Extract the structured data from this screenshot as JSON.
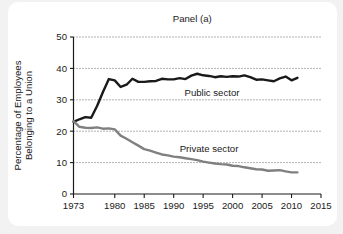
{
  "figure": {
    "background_color": "#f2f2f2",
    "card_color": "#ffffff"
  },
  "chart_data": {
    "type": "line",
    "title": "Panel (a)",
    "xlabel": "",
    "ylabel": "Percentage of Employees Belonging to a Union",
    "ylabel_line1": "Percentage of Employees",
    "ylabel_line2": "Belonging to a Union",
    "xlim": [
      1973,
      2015
    ],
    "ylim": [
      0,
      50
    ],
    "yticks": [
      0,
      10,
      20,
      30,
      40,
      50
    ],
    "ytick_labels": [
      "0",
      "10",
      "20",
      "30",
      "40",
      "50"
    ],
    "xticks": [
      1973,
      1980,
      1985,
      1990,
      1995,
      2000,
      2005,
      2010,
      2015
    ],
    "xtick_labels": [
      "1973",
      "1980",
      "1985",
      "1990",
      "1995",
      "2000",
      "2005",
      "2010",
      "2015"
    ],
    "grid": "horizontal-dotted",
    "legend_position": "inline-annotations",
    "annotations": [
      {
        "text": "Public sector",
        "x": 1996.5,
        "y": 31.2
      },
      {
        "text": "Private sector",
        "x": 1996.0,
        "y": 13.4
      }
    ],
    "series": [
      {
        "name": "Public sector",
        "color": "#1a1a1a",
        "line_width": 2.4,
        "x": [
          1973,
          1974,
          1975,
          1976,
          1977,
          1978,
          1979,
          1980,
          1981,
          1982,
          1983,
          1984,
          1985,
          1986,
          1987,
          1988,
          1989,
          1990,
          1991,
          1992,
          1993,
          1994,
          1995,
          1996,
          1997,
          1998,
          1999,
          2000,
          2001,
          2002,
          2003,
          2004,
          2005,
          2006,
          2007,
          2008,
          2009,
          2010,
          2011
        ],
        "values": [
          23.0,
          23.8,
          24.5,
          24.3,
          28.0,
          32.5,
          36.6,
          36.2,
          34.1,
          34.8,
          36.7,
          35.7,
          35.7,
          35.9,
          36.0,
          36.7,
          36.5,
          36.5,
          36.9,
          36.6,
          37.7,
          38.3,
          37.8,
          37.6,
          37.2,
          37.5,
          37.3,
          37.5,
          37.4,
          37.8,
          37.2,
          36.4,
          36.5,
          36.2,
          35.9,
          36.8,
          37.4,
          36.2,
          37.0
        ],
        "label_at_end": 37.0
      },
      {
        "name": "Private sector",
        "color": "#808080",
        "line_width": 2.4,
        "x": [
          1973,
          1974,
          1975,
          1976,
          1977,
          1978,
          1979,
          1980,
          1981,
          1982,
          1983,
          1984,
          1985,
          1986,
          1987,
          1988,
          1989,
          1990,
          1991,
          1992,
          1993,
          1994,
          1995,
          1996,
          1997,
          1998,
          1999,
          2000,
          2001,
          2002,
          2003,
          2004,
          2005,
          2006,
          2007,
          2008,
          2009,
          2010,
          2011
        ],
        "values": [
          23.2,
          21.4,
          21.1,
          21.0,
          21.2,
          20.8,
          20.9,
          20.6,
          18.6,
          17.6,
          16.5,
          15.4,
          14.3,
          13.8,
          13.2,
          12.6,
          12.3,
          11.9,
          11.7,
          11.4,
          11.1,
          10.8,
          10.3,
          10.0,
          9.7,
          9.5,
          9.4,
          9.0,
          8.9,
          8.5,
          8.2,
          7.9,
          7.8,
          7.4,
          7.5,
          7.6,
          7.2,
          6.9,
          6.9
        ],
        "label_at_end": 6.9
      }
    ]
  }
}
